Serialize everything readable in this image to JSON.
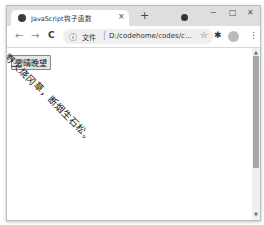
{
  "browser": {
    "tab": {
      "title": "JavaScript钩子函数",
      "favicon": "globe-icon",
      "close": "×"
    },
    "new_tab": "+",
    "window_controls": {
      "minimize": "−",
      "maximize": "□",
      "close": "✕"
    },
    "toolbar": {
      "back": "←",
      "forward": "→",
      "reload": "C",
      "info_icon": "ⓘ",
      "file_label": "文件",
      "separator": "|",
      "url": "D:/codehome/codes/c...",
      "star": "☆",
      "extensions": "✱",
      "menu": "⋮"
    }
  },
  "page": {
    "button_label": "雪晴晚望",
    "rotated_text": "野火烧冈草，断烟生石松。",
    "rotation_deg": 45
  }
}
